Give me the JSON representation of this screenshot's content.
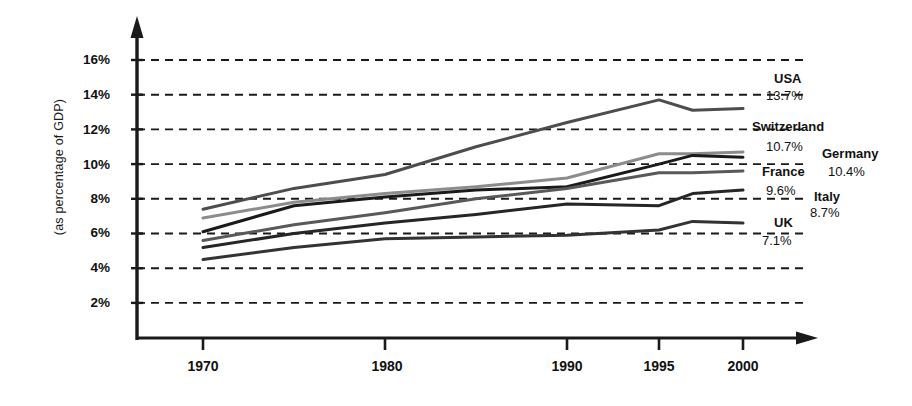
{
  "chart_data": {
    "type": "line",
    "title": "",
    "xlabel": "",
    "ylabel": "(as percentage of GDP)",
    "xlim": [
      1968,
      2003
    ],
    "ylim": [
      1,
      17
    ],
    "grid": true,
    "grid_style": "dashed-horizontal",
    "legend_position": "right-inline-labels",
    "x": [
      1970,
      1975,
      1980,
      1985,
      1990,
      1995,
      1997,
      2000
    ],
    "xticks": [
      "1970",
      "1980",
      "1990",
      "1995",
      "2000"
    ],
    "xtick_values": [
      1970,
      1980,
      1990,
      1995,
      2000
    ],
    "yticks": [
      "2%",
      "4%",
      "6%",
      "8%",
      "10%",
      "12%",
      "14%",
      "16%"
    ],
    "ytick_values": [
      2,
      4,
      6,
      8,
      10,
      12,
      14,
      16
    ],
    "series": [
      {
        "name": "USA",
        "end_label": "13.7%",
        "color": "#4d4d4d",
        "values": [
          7.4,
          8.6,
          9.4,
          11.0,
          12.4,
          13.7,
          13.1,
          13.2
        ]
      },
      {
        "name": "Switzerland",
        "end_label": "10.7%",
        "color": "#8c8c8c",
        "values": [
          6.9,
          7.8,
          8.3,
          8.7,
          9.2,
          10.6,
          10.6,
          10.7
        ]
      },
      {
        "name": "Germany",
        "end_label": "10.4%",
        "color": "#1a1a1a",
        "values": [
          6.1,
          7.6,
          8.1,
          8.5,
          8.7,
          10.0,
          10.5,
          10.4
        ]
      },
      {
        "name": "France",
        "end_label": "9.6%",
        "color": "#595959",
        "values": [
          5.6,
          6.5,
          7.2,
          8.0,
          8.6,
          9.5,
          9.5,
          9.6
        ]
      },
      {
        "name": "Italy",
        "end_label": "8.7%",
        "color": "#262626",
        "values": [
          5.2,
          6.0,
          6.6,
          7.1,
          7.7,
          7.6,
          8.3,
          8.5
        ]
      },
      {
        "name": "UK",
        "end_label": "7.1%",
        "color": "#333333",
        "values": [
          4.5,
          5.2,
          5.7,
          5.8,
          5.9,
          6.2,
          6.7,
          6.6
        ]
      }
    ]
  },
  "axis": {
    "y_title": "(as percentage of GDP)",
    "y_labels": [
      "16%",
      "14%",
      "12%",
      "10%",
      "8%",
      "6%",
      "4%",
      "2%"
    ],
    "x_labels": [
      "1970",
      "1980",
      "1990",
      "1995",
      "2000"
    ]
  },
  "labels": {
    "usa_name": "USA",
    "usa_value": "13.7%",
    "switzerland_name": "Switzerland",
    "switzerland_value": "10.7%",
    "germany_name": "Germany",
    "germany_value": "10.4%",
    "france_name": "France",
    "france_value": "9.6%",
    "italy_name": "Italy",
    "italy_value": "8.7%",
    "uk_name": "UK",
    "uk_value": "7.1%"
  }
}
